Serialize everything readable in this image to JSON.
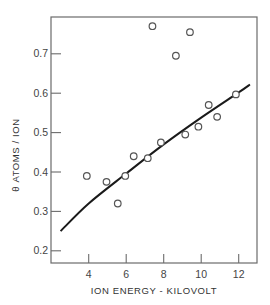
{
  "chart_data": {
    "type": "scatter",
    "title": "",
    "xlabel": "ION ENERGY - KILOVOLT",
    "ylabel": "θ ATOMS / ION",
    "xlim": [
      1.9,
      13.0
    ],
    "ylim": [
      0.17,
      0.79
    ],
    "xticks": [
      4,
      6,
      8,
      10,
      12
    ],
    "xtick_labels": [
      "4",
      "6",
      "8",
      "10",
      "12"
    ],
    "yticks": [
      0.2,
      0.3,
      0.4,
      0.5,
      0.6,
      0.7
    ],
    "ytick_labels": [
      "0.2",
      "0.3",
      "0.4",
      "0.5",
      "0.6",
      "0.7"
    ],
    "grid": false,
    "legend": null,
    "series": [
      {
        "name": "measured",
        "marker": "open-circle",
        "points": [
          {
            "x": 3.9,
            "y": 0.39
          },
          {
            "x": 4.95,
            "y": 0.375
          },
          {
            "x": 5.55,
            "y": 0.32
          },
          {
            "x": 5.95,
            "y": 0.39
          },
          {
            "x": 6.4,
            "y": 0.44
          },
          {
            "x": 7.15,
            "y": 0.435
          },
          {
            "x": 7.4,
            "y": 0.77
          },
          {
            "x": 7.85,
            "y": 0.475
          },
          {
            "x": 8.65,
            "y": 0.695
          },
          {
            "x": 9.15,
            "y": 0.495
          },
          {
            "x": 9.4,
            "y": 0.755
          },
          {
            "x": 9.85,
            "y": 0.515
          },
          {
            "x": 10.4,
            "y": 0.57
          },
          {
            "x": 10.85,
            "y": 0.54
          },
          {
            "x": 11.85,
            "y": 0.597
          }
        ]
      },
      {
        "name": "fit curve",
        "style": "solid-line",
        "points": [
          {
            "x": 2.5,
            "y": 0.25
          },
          {
            "x": 4,
            "y": 0.32
          },
          {
            "x": 6,
            "y": 0.396
          },
          {
            "x": 8,
            "y": 0.47
          },
          {
            "x": 10,
            "y": 0.538
          },
          {
            "x": 12,
            "y": 0.602
          },
          {
            "x": 12.6,
            "y": 0.622
          }
        ]
      }
    ]
  },
  "layout": {
    "plot": {
      "left": 51,
      "right": 257,
      "top": 17,
      "bottom": 263
    },
    "x_px_per_unit": 18.75,
    "x_zero_px": 13.7,
    "y_px_per_unit": 394,
    "y_ref_value": 0.4,
    "y_ref_px": 172,
    "colors": {
      "frame": "#6b6b6b",
      "line": "#1a1a1a",
      "marker": "#555555",
      "text": "#444444"
    }
  }
}
